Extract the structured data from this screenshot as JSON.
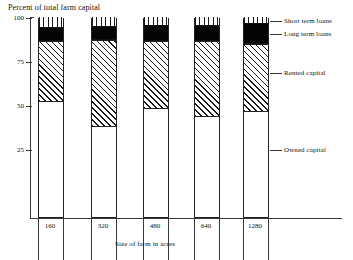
{
  "chart_data": {
    "type": "bar",
    "subtype": "stacked-bar",
    "title": "",
    "ylabel": "Percent of total farm capital",
    "xlabel": "Size of farm in acres",
    "categories": [
      "160",
      "320",
      "480",
      "640",
      "1280"
    ],
    "ylim": [
      0,
      100
    ],
    "yticks": [
      100,
      75,
      50,
      25
    ],
    "ytick_labels": [
      "100",
      "75",
      "50",
      "25"
    ],
    "grid": false,
    "legend_position": "right",
    "stack_order_bottom_to_top": [
      "Owned capital",
      "Rented capital",
      "Long term loans",
      "Short term loans"
    ],
    "series": [
      {
        "name": "Owned capital",
        "fill": "solid-white",
        "values": [
          57.5,
          45.0,
          54.0,
          50.0,
          52.5
        ]
      },
      {
        "name": "Rented capital",
        "fill": "diagonal-hatch",
        "values": [
          30.5,
          43.5,
          34.0,
          38.0,
          34.0
        ]
      },
      {
        "name": "Long term loans",
        "fill": "solid-black",
        "values": [
          7.0,
          7.0,
          8.0,
          8.0,
          10.5
        ]
      },
      {
        "name": "Short term loans",
        "fill": "vertical-hatch",
        "values": [
          5.0,
          4.5,
          4.0,
          4.0,
          3.0
        ]
      }
    ],
    "cumulative_tops": [
      [
        57.5,
        88.0,
        95.0,
        100.0
      ],
      [
        45.0,
        88.5,
        95.5,
        100.0
      ],
      [
        54.0,
        88.0,
        96.0,
        100.0
      ],
      [
        50.0,
        88.0,
        96.0,
        100.0
      ],
      [
        52.5,
        86.5,
        97.0,
        100.0
      ]
    ]
  },
  "legend": {
    "items": [
      {
        "label": "Short term loans"
      },
      {
        "label": "Long term loans"
      },
      {
        "label": "Rented capital"
      },
      {
        "label": "Owned capital"
      }
    ]
  }
}
